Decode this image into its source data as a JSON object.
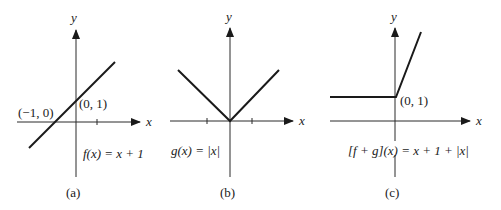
{
  "panels": [
    {
      "id": "a",
      "caption": "(a)",
      "axis_x_label": "x",
      "axis_y_label": "y",
      "function_label": "f(x) = x + 1",
      "points": [
        {
          "label": "(−1, 0)",
          "x": -1,
          "y": 0
        },
        {
          "label": "(0, 1)",
          "x": 0,
          "y": 1
        }
      ]
    },
    {
      "id": "b",
      "caption": "(b)",
      "axis_x_label": "x",
      "axis_y_label": "y",
      "function_label": "g(x) = |x|",
      "points": []
    },
    {
      "id": "c",
      "caption": "(c)",
      "axis_x_label": "x",
      "axis_y_label": "y",
      "function_label": "[f + g](x) = x + 1 + |x|",
      "points": [
        {
          "label": "(0, 1)",
          "x": 0,
          "y": 1
        }
      ]
    }
  ],
  "colors": {
    "ink": "#1a1a1a",
    "background": "#ffffff"
  }
}
